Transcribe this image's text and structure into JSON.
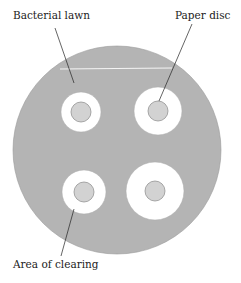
{
  "diagram": {
    "labels": {
      "bacterial_lawn": "Bacterial lawn",
      "paper_disc": "Paper disc",
      "area_of_clearing": "Area of clearing"
    },
    "colors": {
      "lawn": "#b4b4b4",
      "clearing": "#ffffff",
      "disc": "#d2d2d2",
      "outline": "#888888"
    },
    "plate": {
      "cx": 117,
      "cy": 150,
      "r": 104
    },
    "discs": [
      {
        "position": "top-left",
        "cx": 81,
        "cy": 112,
        "clear_r": 20,
        "disc_r": 10
      },
      {
        "position": "top-right",
        "cx": 158,
        "cy": 111,
        "clear_r": 24,
        "disc_r": 10
      },
      {
        "position": "bottom-left",
        "cx": 84,
        "cy": 192,
        "clear_r": 22,
        "disc_r": 10
      },
      {
        "position": "bottom-right",
        "cx": 155,
        "cy": 191,
        "clear_r": 29,
        "disc_r": 10
      }
    ]
  }
}
